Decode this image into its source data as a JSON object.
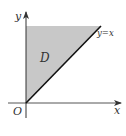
{
  "diagram": {
    "type": "region-plot",
    "axes": {
      "x_label": "x",
      "y_label": "y",
      "origin_label": "O"
    },
    "region": {
      "label": "D",
      "description": "Shaded triangle bounded by y-axis, line y=x and top edge",
      "fill_color": "#c8c8c8"
    },
    "line": {
      "label": "y=x",
      "color": "#111111"
    },
    "colors": {
      "axis": "#333333",
      "background": "#ffffff"
    }
  }
}
